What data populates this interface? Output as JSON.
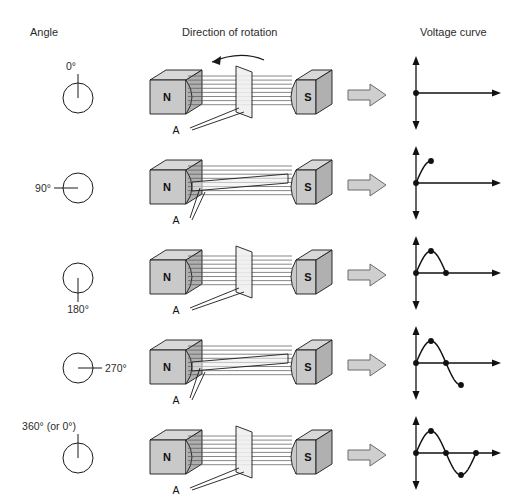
{
  "headers": {
    "angle": "Angle",
    "rotation": "Direction of rotation",
    "voltage": "Voltage curve"
  },
  "labels": {
    "north_pole": "N",
    "south_pole": "S",
    "coil_lead": "A"
  },
  "colors": {
    "magnet_face": "#c9c9c9",
    "magnet_top": "#d8d8d8",
    "magnet_side": "#b0b0b0",
    "coil_fill": "#efefef",
    "stroke": "#1a1a1a",
    "block_arrow_fill": "#cfcfcf",
    "field_line": "#555555",
    "background": "#ffffff"
  },
  "rows": [
    {
      "angle_label": "0°",
      "angle_label_position": "top",
      "needle_direction": "up",
      "coil_orientation": "face-on",
      "rotation_arrow": true,
      "block_arrow": "⇒",
      "curve": {
        "description": "zero voltage, flat at origin",
        "points": [
          [
            0,
            0
          ]
        ],
        "dots": [
          [
            0,
            0
          ]
        ],
        "path_degrees": 0
      }
    },
    {
      "angle_label": "90°",
      "angle_label_position": "left",
      "needle_direction": "left",
      "coil_orientation": "edge-on",
      "rotation_arrow": false,
      "block_arrow": "⇒",
      "curve": {
        "description": "rising quarter sine to positive peak",
        "dots": [
          [
            0,
            0
          ],
          [
            90,
            1
          ]
        ],
        "path_degrees": 90
      }
    },
    {
      "angle_label": "180°",
      "angle_label_position": "bottom",
      "needle_direction": "down",
      "coil_orientation": "face-on",
      "rotation_arrow": false,
      "block_arrow": "⇒",
      "curve": {
        "description": "positive half cycle returning to zero",
        "dots": [
          [
            0,
            0
          ],
          [
            90,
            1
          ],
          [
            180,
            0
          ]
        ],
        "path_degrees": 180
      }
    },
    {
      "angle_label": "270°",
      "angle_label_position": "right",
      "needle_direction": "right",
      "coil_orientation": "edge-on",
      "rotation_arrow": false,
      "block_arrow": "⇒",
      "curve": {
        "description": "positive half plus descent to negative peak",
        "dots": [
          [
            0,
            0
          ],
          [
            90,
            1
          ],
          [
            180,
            0
          ],
          [
            270,
            -1
          ]
        ],
        "path_degrees": 270
      }
    },
    {
      "angle_label": "360° (or 0°)",
      "angle_label_position": "top",
      "needle_direction": "up",
      "coil_orientation": "face-on",
      "rotation_arrow": false,
      "block_arrow": "⇒",
      "curve": {
        "description": "one complete sine cycle",
        "dots": [
          [
            0,
            0
          ],
          [
            90,
            1
          ],
          [
            180,
            0
          ],
          [
            270,
            -1
          ],
          [
            360,
            0
          ]
        ],
        "path_degrees": 360
      }
    }
  ],
  "chart_data": {
    "type": "line",
    "title": "Voltage curve",
    "xlabel": "Rotation angle (degrees)",
    "ylabel": "Induced voltage",
    "x": [
      0,
      90,
      180,
      270,
      360
    ],
    "series": [
      {
        "name": "Induced EMF (sine)",
        "values": [
          0,
          1,
          0,
          -1,
          0
        ]
      }
    ],
    "xlim": [
      0,
      360
    ],
    "ylim": [
      -1,
      1
    ],
    "grid": false,
    "legend": "none"
  }
}
